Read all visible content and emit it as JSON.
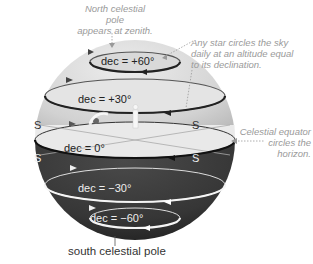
{
  "diagram": {
    "annotations": {
      "zenith": [
        "North celestial pole",
        "appears at zenith."
      ],
      "star_circles": [
        "Any star circles the sky",
        "daily at an altitude equal",
        "to its declination."
      ],
      "equator": [
        "Celestial equator",
        "circles the horizon."
      ]
    },
    "circles": [
      {
        "label": "dec = +60°"
      },
      {
        "label": "dec = +30°"
      },
      {
        "label": "dec = 0°"
      },
      {
        "label": "dec = −30°"
      },
      {
        "label": "dec = −60°"
      }
    ],
    "horizon_labels": {
      "upper_left": "S",
      "upper_right": "S",
      "lower_left": "S",
      "lower_right": "S"
    },
    "south_pole_label": "south celestial pole",
    "colors": {
      "upper_sphere": "#d6d6d6",
      "lower_sphere": "#3a3a3a",
      "horizon_plane": "#e9e9e9",
      "annotation_text": "#9a9a9a"
    }
  }
}
